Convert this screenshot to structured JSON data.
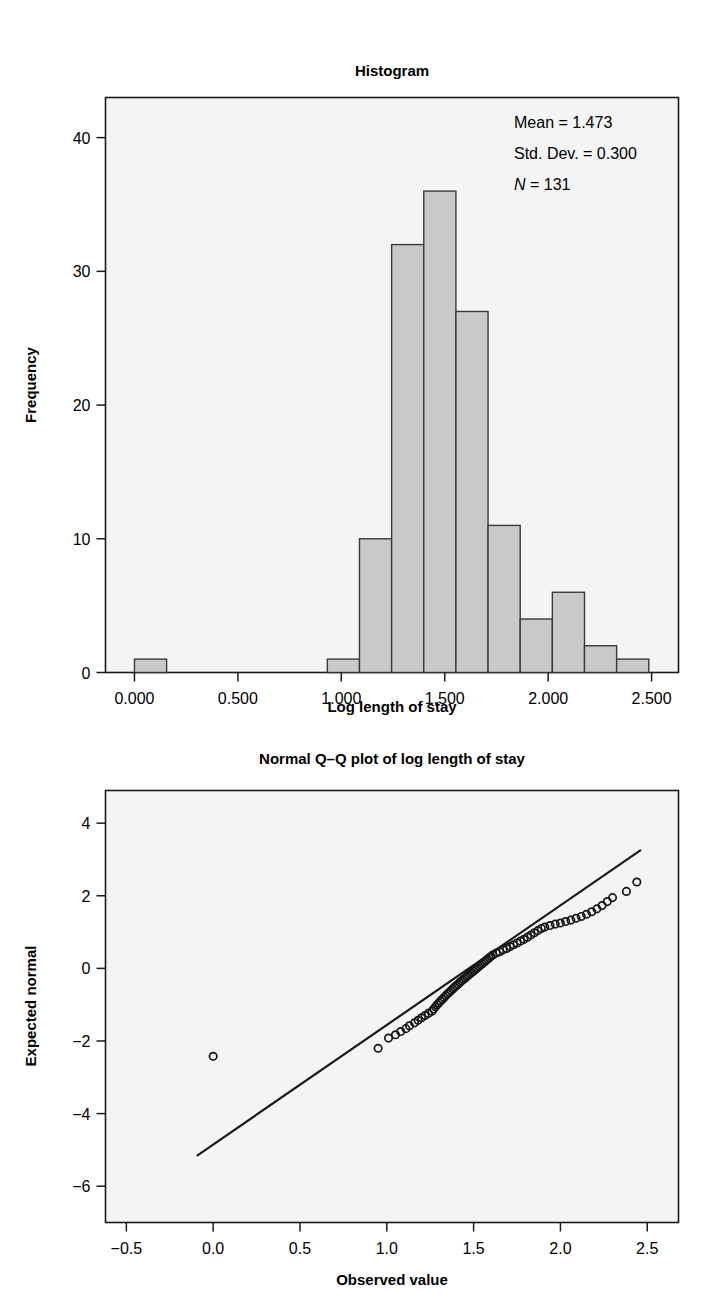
{
  "figure": {
    "background": "#ffffff",
    "bar_fill": "#c9c9c9",
    "bar_edge": "#3a3a3a",
    "plot_bg": "#f4f4f4",
    "axis_color": "#1a1a1a"
  },
  "histogram": {
    "title": "Histogram",
    "xlabel": "Log length of stay",
    "ylabel": "Frequency",
    "annotations": {
      "mean_label": "Mean = 1.473",
      "sd_label": "Std. Dev. = 0.300",
      "n_symbol": "N",
      "n_rest": " = 131"
    },
    "x_ticks": [
      "0.000",
      "0.500",
      "1.000",
      "1.500",
      "2.000",
      "2.500"
    ],
    "x_tick_values": [
      0.0,
      0.5,
      1.0,
      1.5,
      2.0,
      2.5
    ],
    "y_ticks": [
      "0",
      "10",
      "20",
      "30",
      "40"
    ],
    "y_tick_values": [
      0,
      10,
      20,
      30,
      40
    ]
  },
  "qqplot": {
    "title": "Normal Q–Q plot of log length of stay",
    "xlabel": "Observed value",
    "ylabel": "Expected normal",
    "x_ticks": [
      "−0.5",
      "0.0",
      "0.5",
      "1.0",
      "1.5",
      "2.0",
      "2.5"
    ],
    "x_tick_values": [
      -0.5,
      0.0,
      0.5,
      1.0,
      1.5,
      2.0,
      2.5
    ],
    "y_ticks": [
      "4",
      "2",
      "0",
      "−2",
      "−4",
      "−6"
    ],
    "y_tick_values": [
      4,
      2,
      0,
      -2,
      -4,
      -6
    ]
  },
  "chart_data": [
    {
      "type": "bar",
      "id": "histogram",
      "title": "Histogram",
      "xlabel": "Log length of stay",
      "ylabel": "Frequency",
      "xlim": [
        -0.14,
        2.63
      ],
      "ylim": [
        0,
        43
      ],
      "grid": false,
      "legend": "none",
      "bin_width": 0.1554,
      "bin_starts": [
        0.0,
        0.1554,
        0.3108,
        0.4662,
        0.6216,
        0.777,
        0.9324,
        1.0878,
        1.2432,
        1.3986,
        1.554,
        1.7094,
        1.8648,
        2.0202,
        2.1756,
        2.331
      ],
      "bin_centers": [
        0.078,
        0.233,
        0.388,
        0.544,
        0.699,
        0.855,
        1.01,
        1.165,
        1.321,
        1.476,
        1.632,
        1.787,
        1.942,
        2.098,
        2.253,
        2.409
      ],
      "values": [
        1,
        0,
        0,
        0,
        0,
        0,
        1,
        10,
        32,
        36,
        27,
        11,
        4,
        6,
        2,
        1
      ],
      "annotations": [
        "Mean = 1.473",
        "Std. Dev. = 0.300",
        "N = 131"
      ],
      "statistics": {
        "mean": 1.473,
        "std_dev": 0.3,
        "n": 131
      }
    },
    {
      "type": "scatter",
      "id": "normal-qq-plot",
      "title": "Normal Q–Q plot of log length of stay",
      "xlabel": "Observed value",
      "ylabel": "Expected normal",
      "xlim": [
        -0.62,
        2.68
      ],
      "ylim": [
        -7.0,
        4.9
      ],
      "grid": false,
      "legend": "none",
      "marker": "open-circle",
      "reference_line": {
        "x": [
          -0.09,
          2.46
        ],
        "y": [
          -5.15,
          3.25
        ]
      },
      "points": [
        [
          0.0,
          -2.42
        ],
        [
          0.95,
          -2.2
        ],
        [
          1.01,
          -1.92
        ],
        [
          1.05,
          -1.83
        ],
        [
          1.08,
          -1.74
        ],
        [
          1.11,
          -1.66
        ],
        [
          1.13,
          -1.58
        ],
        [
          1.16,
          -1.5
        ],
        [
          1.18,
          -1.43
        ],
        [
          1.2,
          -1.36
        ],
        [
          1.22,
          -1.3
        ],
        [
          1.24,
          -1.24
        ],
        [
          1.26,
          -1.18
        ],
        [
          1.27,
          -1.12
        ],
        [
          1.28,
          -1.06
        ],
        [
          1.29,
          -1.0
        ],
        [
          1.3,
          -0.95
        ],
        [
          1.31,
          -0.9
        ],
        [
          1.32,
          -0.85
        ],
        [
          1.33,
          -0.8
        ],
        [
          1.34,
          -0.75
        ],
        [
          1.35,
          -0.7
        ],
        [
          1.36,
          -0.66
        ],
        [
          1.37,
          -0.61
        ],
        [
          1.38,
          -0.57
        ],
        [
          1.39,
          -0.52
        ],
        [
          1.4,
          -0.48
        ],
        [
          1.41,
          -0.44
        ],
        [
          1.42,
          -0.39
        ],
        [
          1.43,
          -0.35
        ],
        [
          1.44,
          -0.31
        ],
        [
          1.45,
          -0.27
        ],
        [
          1.46,
          -0.23
        ],
        [
          1.47,
          -0.19
        ],
        [
          1.48,
          -0.15
        ],
        [
          1.49,
          -0.11
        ],
        [
          1.5,
          -0.07
        ],
        [
          1.51,
          -0.03
        ],
        [
          1.52,
          0.01
        ],
        [
          1.53,
          0.05
        ],
        [
          1.54,
          0.09
        ],
        [
          1.55,
          0.13
        ],
        [
          1.56,
          0.17
        ],
        [
          1.57,
          0.21
        ],
        [
          1.58,
          0.25
        ],
        [
          1.59,
          0.29
        ],
        [
          1.6,
          0.33
        ],
        [
          1.61,
          0.37
        ],
        [
          1.63,
          0.42
        ],
        [
          1.65,
          0.46
        ],
        [
          1.67,
          0.51
        ],
        [
          1.69,
          0.55
        ],
        [
          1.71,
          0.6
        ],
        [
          1.73,
          0.65
        ],
        [
          1.75,
          0.7
        ],
        [
          1.77,
          0.75
        ],
        [
          1.79,
          0.8
        ],
        [
          1.81,
          0.86
        ],
        [
          1.83,
          0.92
        ],
        [
          1.85,
          0.98
        ],
        [
          1.87,
          1.04
        ],
        [
          1.89,
          1.1
        ],
        [
          1.91,
          1.14
        ],
        [
          1.94,
          1.18
        ],
        [
          1.97,
          1.22
        ],
        [
          2.0,
          1.25
        ],
        [
          2.03,
          1.29
        ],
        [
          2.06,
          1.33
        ],
        [
          2.09,
          1.38
        ],
        [
          2.12,
          1.43
        ],
        [
          2.15,
          1.49
        ],
        [
          2.18,
          1.56
        ],
        [
          2.21,
          1.64
        ],
        [
          2.24,
          1.73
        ],
        [
          2.27,
          1.84
        ],
        [
          2.3,
          1.95
        ],
        [
          2.38,
          2.12
        ],
        [
          2.44,
          2.38
        ]
      ]
    }
  ]
}
